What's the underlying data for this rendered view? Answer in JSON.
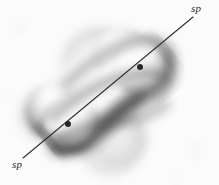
{
  "figure": {
    "background_color": "#fdfdfd",
    "width": 219,
    "height": 185,
    "style": "grayscale airbrush shaded illustration"
  },
  "labels": {
    "top_right": "sp",
    "bottom_left": "sp"
  },
  "axis": {
    "name": "bond-axis",
    "color": "#1a1a1a",
    "stroke_width": 1.1,
    "start": {
      "x": 23,
      "y": 158
    },
    "end": {
      "x": 193,
      "y": 17
    },
    "angle_degrees": -39.7
  },
  "nuclei": [
    {
      "name": "nucleus-left",
      "x": 68,
      "y": 124,
      "radius": 3.0,
      "color": "#111111"
    },
    {
      "name": "nucleus-right",
      "x": 140,
      "y": 67,
      "radius": 3.0,
      "color": "#111111"
    }
  ],
  "lobes": [
    {
      "name": "back-lobe-left-far",
      "cx": 46,
      "cy": 113,
      "rx": 27,
      "ry": 25,
      "tone": "faint"
    },
    {
      "name": "back-lobe-upper",
      "cx": 96,
      "cy": 57,
      "rx": 30,
      "ry": 26,
      "tone": "faint"
    },
    {
      "name": "back-lobe-lower",
      "cx": 118,
      "cy": 140,
      "rx": 30,
      "ry": 26,
      "tone": "faint"
    },
    {
      "name": "front-lobe-left",
      "cx": 72,
      "cy": 102,
      "rx": 30,
      "ry": 27,
      "tone": "shaded"
    },
    {
      "name": "front-lobe-right",
      "cx": 158,
      "cy": 82,
      "rx": 30,
      "ry": 27,
      "tone": "shaded"
    },
    {
      "name": "bonding-lobe-center",
      "cx": 113,
      "cy": 93,
      "rx": 48,
      "ry": 30,
      "tone": "shaded"
    }
  ],
  "grayscale": {
    "highlight": "#fbfbfb",
    "midtone": "#b8b8b8",
    "shadow": "#4a4a4a",
    "deep_shadow": "#242424",
    "faint_backdrop": "#d9d9d9"
  }
}
